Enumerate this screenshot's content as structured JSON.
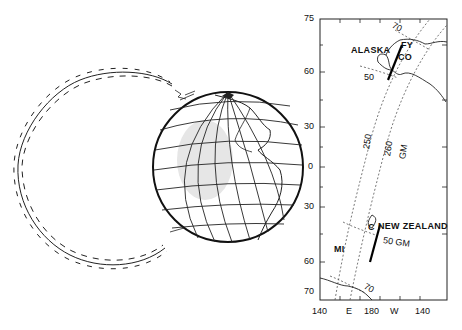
{
  "figure": {
    "left_panel": {
      "description": "Magnetic field line loop from Earth with particle path spiraling around it",
      "globe": "Earth globe showing Americas with latitude/longitude grid"
    },
    "right_panel": {
      "y_axis_ticks": [
        "75",
        "60",
        "30",
        "0",
        "30",
        "60",
        "70"
      ],
      "x_axis_ticks": [
        "140",
        "E",
        "180",
        "W",
        "140"
      ],
      "labels": {
        "alaska": "ALASKA",
        "fy": "FY",
        "co": "CO",
        "new_zealand": "NEW ZEALAND",
        "c": "C",
        "mi": "MI",
        "gm_50": "50 GM",
        "gm_250": "250",
        "gm_260": "260",
        "gm": "GM",
        "lat70_north": "70",
        "lat50_north": "50",
        "lat70_south": "70"
      }
    }
  }
}
